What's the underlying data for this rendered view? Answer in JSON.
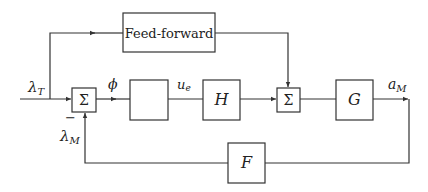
{
  "diagram": {
    "type": "block-diagram",
    "blocks": {
      "feedforward": {
        "label": "Feed-forward"
      },
      "sum1": {
        "label": "Σ"
      },
      "controller": {
        "label": ""
      },
      "h": {
        "label": "H"
      },
      "sum2": {
        "label": "Σ"
      },
      "g": {
        "label": "G"
      },
      "f": {
        "label": "F"
      }
    },
    "signals": {
      "input": {
        "sym": "λ",
        "sub": "T"
      },
      "error": {
        "sym": "ϕ"
      },
      "control": {
        "sym": "u",
        "sub": "e"
      },
      "output": {
        "sym": "a",
        "sub": "M"
      },
      "feedback": {
        "sym": "λ",
        "sub": "M"
      },
      "minus_sign": "−"
    }
  }
}
